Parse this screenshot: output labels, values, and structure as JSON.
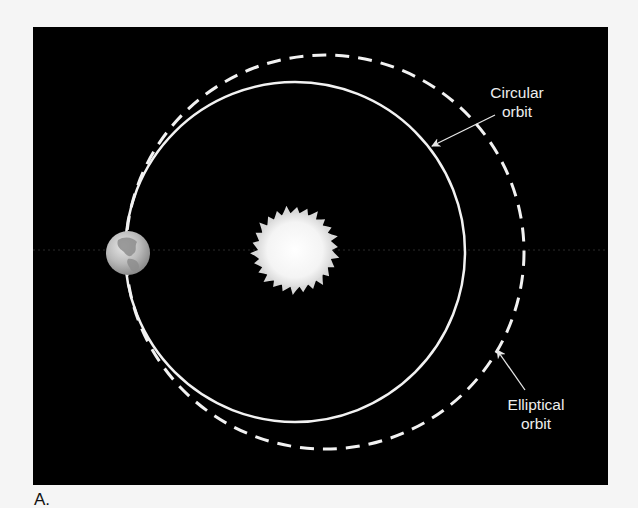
{
  "figure": {
    "panel_label": "A.",
    "background_color": "#000000",
    "orbit_color": "#f2f2f2",
    "labels": {
      "circular_orbit": [
        "Circular",
        "orbit"
      ],
      "elliptical_orbit": [
        "Elliptical",
        "orbit"
      ]
    },
    "objects": {
      "sun": "sun",
      "earth": "earth"
    }
  }
}
